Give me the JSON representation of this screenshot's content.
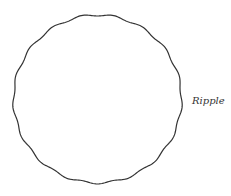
{
  "shape": {
    "name": "Ripple",
    "stroke": "#333333",
    "fill": "#ffffff"
  },
  "label": "Ripple"
}
